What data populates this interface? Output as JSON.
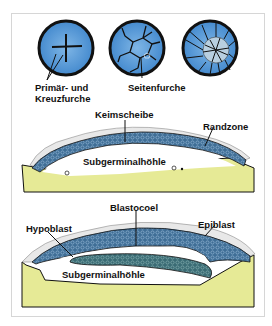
{
  "stages": [
    {
      "name": "stage-1",
      "label": "Primär- und\nKreuzfurche",
      "label_line1": "Primär- und",
      "label_line2": "Kreuzfurche"
    },
    {
      "name": "stage-2",
      "label": "Seitenfurche"
    },
    {
      "name": "stage-3",
      "label": ""
    }
  ],
  "section1": {
    "keimscheibe": "Keimscheibe",
    "randzone": "Randzone",
    "subgerminalhoehle": "Subgerminalhöhle"
  },
  "section2": {
    "blastocoel": "Blastocoel",
    "hypoblast": "Hypoblast",
    "epiblast": "Epiblast",
    "subgerminalhoehle": "Subgerminalhöhle"
  },
  "colors": {
    "disc_blue": "#4a90d0",
    "cell_layer": "#3e6f95",
    "hypoblast": "#3a6a78",
    "yolk": "#e6ea96",
    "outline": "#111111"
  }
}
